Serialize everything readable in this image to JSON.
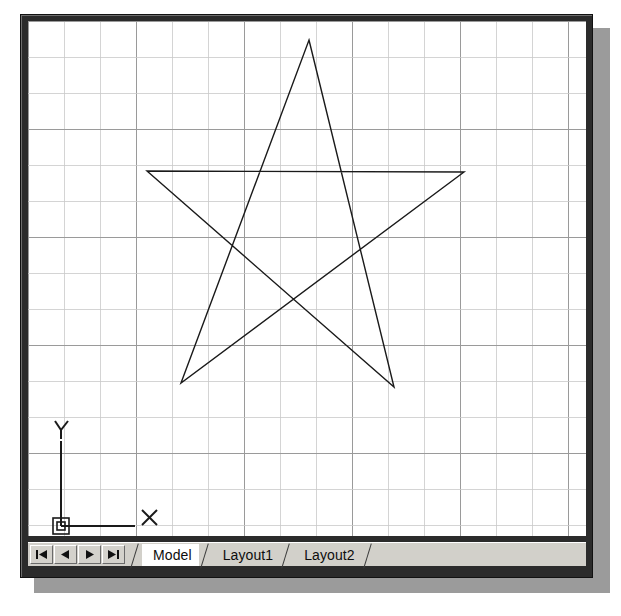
{
  "app": {
    "kind": "cad-drawing-window",
    "canvas_background": "#ffffff",
    "frame_color": "#2b2b2b",
    "shadow_color": "#9b9b9b"
  },
  "canvas": {
    "grid": {
      "visible": true,
      "spacing_px": 36,
      "minor_color": "#c9c9c9",
      "major_color": "#9a9a9a",
      "major_every": 1,
      "columns": 15,
      "rows": 14
    },
    "ucs_icon": {
      "x_label": "X",
      "y_label": "Y",
      "origin_x": 52,
      "origin_y": 522,
      "color": "#1a1a1a"
    },
    "geometry": {
      "name": "five-pointed-star",
      "stroke_color": "#1a1a1a",
      "stroke_width": 1.4,
      "closed": true,
      "vertices": [
        {
          "label": "top-apex",
          "x": 281,
          "y": 19
        },
        {
          "label": "bottom-right-point",
          "x": 366,
          "y": 366
        },
        {
          "label": "left-point",
          "x": 119,
          "y": 150
        },
        {
          "label": "right-point",
          "x": 436,
          "y": 151
        },
        {
          "label": "bottom-left-point",
          "x": 153,
          "y": 362
        }
      ]
    }
  },
  "tab_strip": {
    "nav_buttons": [
      {
        "name": "first-sheet-button",
        "icon": "first-arrow-icon",
        "label": "|◀"
      },
      {
        "name": "previous-sheet-button",
        "icon": "previous-arrow-icon",
        "label": "◀"
      },
      {
        "name": "next-sheet-button",
        "icon": "next-arrow-icon",
        "label": "▶"
      },
      {
        "name": "last-sheet-button",
        "icon": "last-arrow-icon",
        "label": "▶|"
      }
    ],
    "tabs": [
      {
        "label": "Model",
        "active": true
      },
      {
        "label": "Layout1",
        "active": false
      },
      {
        "label": "Layout2",
        "active": false
      }
    ]
  }
}
